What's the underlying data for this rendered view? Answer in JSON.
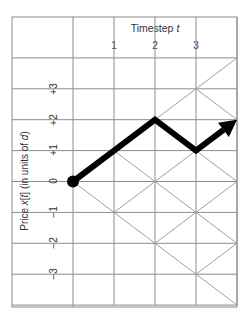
{
  "header": {
    "title": "Timestep ",
    "title_var": "t",
    "ticks": [
      "1",
      "2",
      "3"
    ]
  },
  "y_axis": {
    "label_pre": "Price ",
    "label_var": "x",
    "label_mid": "[",
    "label_var2": "t",
    "label_post": "] (in units of ",
    "label_var3": "d",
    "label_end": ")",
    "ticks": [
      "+3",
      "+2",
      "+1",
      "0",
      "−1",
      "−2",
      "−3"
    ]
  },
  "lattice": {
    "timesteps": 4,
    "max_level": 4,
    "grid_color": "#8c8c8c",
    "diagonal_color": "#a0a0a0"
  },
  "path": {
    "points": [
      [
        0,
        0
      ],
      [
        1,
        1
      ],
      [
        2,
        2
      ],
      [
        3,
        1
      ],
      [
        4,
        2
      ]
    ],
    "color": "#000000",
    "start_marker": "dot",
    "end_marker": "arrow"
  }
}
